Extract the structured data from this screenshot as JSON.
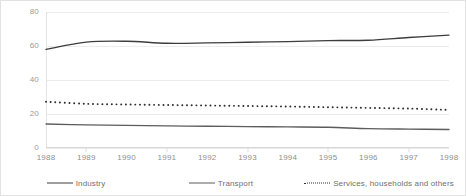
{
  "chart_data": {
    "type": "line",
    "title": "",
    "xlabel": "",
    "ylabel": "",
    "x": [
      1988,
      1989,
      1990,
      1991,
      1992,
      1993,
      1994,
      1995,
      1996,
      1997,
      1998
    ],
    "categories": [
      "1988",
      "1989",
      "1990",
      "1991",
      "1992",
      "1993",
      "1994",
      "1995",
      "1996",
      "1997",
      "1998"
    ],
    "ylim": [
      0,
      80
    ],
    "yticks": [
      0,
      20,
      40,
      60,
      80
    ],
    "ytick_labels": [
      "0",
      "20",
      "40",
      "60",
      "80"
    ],
    "grid": true,
    "legend_position": "bottom",
    "series": [
      {
        "name": "Industry",
        "style": "solid",
        "color": "#3d3d3d",
        "values": [
          58.0,
          62.3,
          62.8,
          61.6,
          61.8,
          62.2,
          62.6,
          63.2,
          63.4,
          65.0,
          66.4
        ]
      },
      {
        "name": "Transport",
        "style": "solid",
        "color": "#5c5c5c",
        "values": [
          14.1,
          13.6,
          13.3,
          13.0,
          12.8,
          12.6,
          12.4,
          12.2,
          11.4,
          11.1,
          10.9
        ]
      },
      {
        "name": "Services, households and others",
        "style": "dotted",
        "color": "#2f2f2f",
        "values": [
          27.2,
          26.0,
          25.6,
          25.3,
          25.0,
          24.7,
          24.4,
          24.0,
          23.6,
          23.2,
          22.4
        ]
      }
    ]
  },
  "legend": {
    "items": [
      {
        "label": "Industry"
      },
      {
        "label": "Transport"
      },
      {
        "label": "Services, households and others"
      }
    ]
  },
  "colors": {
    "industry": "#3d3d3d",
    "transport": "#5c5c5c",
    "services": "#2f2f2f",
    "gridline": "#ececec",
    "tick_text": "#8f8f8f",
    "background": "#ffffff"
  }
}
